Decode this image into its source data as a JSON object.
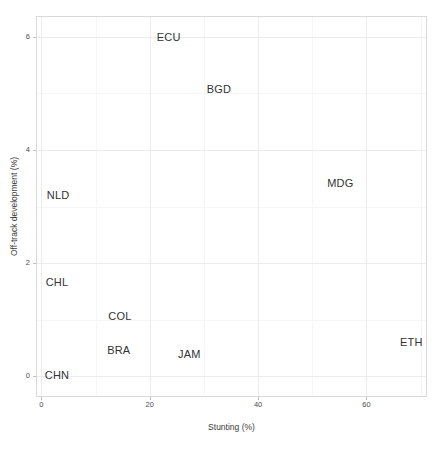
{
  "chart_data": {
    "type": "scatter",
    "title": "",
    "xlabel": "Stunting (%)",
    "ylabel": "Off-track development (%)",
    "xlim": [
      -0.8,
      71.0
    ],
    "ylim": [
      -0.35,
      6.35
    ],
    "xticks": [
      0,
      20,
      40,
      60
    ],
    "xticklabels": [
      "0",
      "20",
      "40",
      "60"
    ],
    "yticks": [
      0,
      2,
      4,
      6
    ],
    "yticklabels": [
      "0",
      "2",
      "4",
      "6"
    ],
    "grid": true,
    "legend": "none",
    "point_marker": "text-label",
    "points": [
      {
        "label": "ECU",
        "x": 23.5,
        "y": 6.0
      },
      {
        "label": "BGD",
        "x": 32.8,
        "y": 5.07
      },
      {
        "label": "MDG",
        "x": 55.2,
        "y": 3.41
      },
      {
        "label": "NLD",
        "x": 3.1,
        "y": 3.21
      },
      {
        "label": "CHL",
        "x": 2.9,
        "y": 1.67
      },
      {
        "label": "COL",
        "x": 14.5,
        "y": 1.07
      },
      {
        "label": "BRA",
        "x": 14.3,
        "y": 0.47
      },
      {
        "label": "JAM",
        "x": 27.3,
        "y": 0.39
      },
      {
        "label": "ETH",
        "x": 68.3,
        "y": 0.6
      },
      {
        "label": "CHN",
        "x": 2.9,
        "y": 0.03
      }
    ]
  },
  "style": {
    "panel_background": "#ffffff",
    "panel_border": "#d9d9d9",
    "gridline_major": "#ececec",
    "gridline_minor": "#f6f6f6",
    "label_color": "#333333",
    "axis_text_color": "#4d4d4d"
  }
}
